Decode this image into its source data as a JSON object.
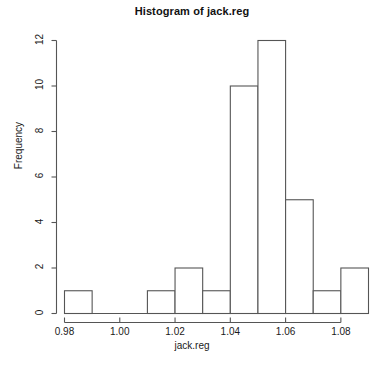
{
  "chart_data": {
    "type": "bar",
    "title": "Histogram of jack.reg",
    "xlabel": "jack.reg",
    "ylabel": "Frequency",
    "bin_width": 0.01,
    "bin_edges": [
      0.98,
      0.99,
      1.0,
      1.01,
      1.02,
      1.03,
      1.04,
      1.05,
      1.06,
      1.07,
      1.08,
      1.09
    ],
    "categories": [
      "0.98-0.99",
      "0.99-1.00",
      "1.00-1.01",
      "1.01-1.02",
      "1.02-1.03",
      "1.03-1.04",
      "1.04-1.05",
      "1.05-1.06",
      "1.06-1.07",
      "1.07-1.08",
      "1.08-1.09"
    ],
    "values": [
      1,
      0,
      0,
      1,
      2,
      1,
      10,
      12,
      5,
      1,
      2
    ],
    "xlim": [
      0.98,
      1.09
    ],
    "ylim": [
      0,
      12
    ],
    "xticks": [
      0.98,
      1.0,
      1.02,
      1.04,
      1.06,
      1.08
    ],
    "xtick_labels": [
      "0.98",
      "1.00",
      "1.02",
      "1.04",
      "1.06",
      "1.08"
    ],
    "yticks": [
      0,
      2,
      4,
      6,
      8,
      10,
      12
    ],
    "ytick_labels": [
      "0",
      "2",
      "4",
      "6",
      "8",
      "10",
      "12"
    ],
    "grid": false,
    "legend": false,
    "bar_fill": "#ffffff",
    "bar_stroke": "#555555",
    "axis_color": "#555555",
    "background": "#ffffff"
  }
}
